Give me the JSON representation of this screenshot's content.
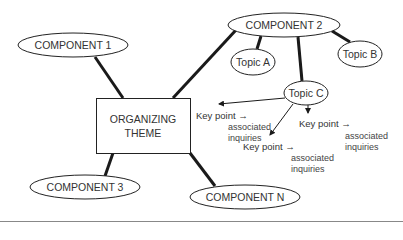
{
  "diagram": {
    "theme": {
      "line1": "ORGANIZING",
      "line2": "THEME"
    },
    "components": [
      {
        "id": "c1",
        "label": "COMPONENT 1"
      },
      {
        "id": "c2",
        "label": "COMPONENT 2"
      },
      {
        "id": "c3",
        "label": "COMPONENT 3"
      },
      {
        "id": "cn",
        "label": "COMPONENT N"
      }
    ],
    "topics": [
      {
        "id": "ta",
        "label": "Topic A"
      },
      {
        "id": "tb",
        "label": "Topic B"
      },
      {
        "id": "tc",
        "label": "Topic C"
      }
    ],
    "key_points": [
      {
        "label": "Key point →",
        "inquiry_line1": "associated",
        "inquiry_line2": "inquiries"
      },
      {
        "label": "Key point →",
        "inquiry_line1": "associated",
        "inquiry_line2": "inquiries"
      },
      {
        "label": "Key point →",
        "inquiry_line1": "associated",
        "inquiry_line2": "inquiries"
      }
    ],
    "colors": {
      "line": "#1a1a1a",
      "stroke": "#222222",
      "text": "#333333",
      "rule": "#888888"
    }
  }
}
